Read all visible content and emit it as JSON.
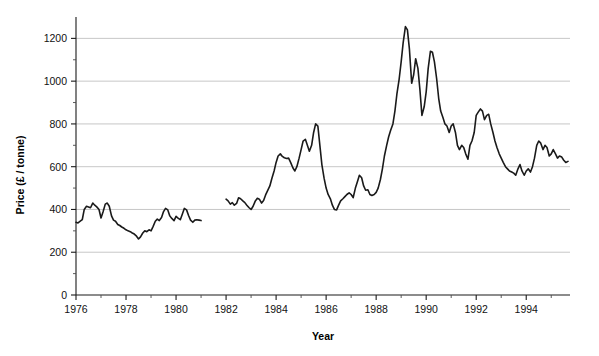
{
  "chart_data": {
    "type": "line",
    "title": "",
    "xlabel": "Year",
    "ylabel": "Price (£ / tonne)",
    "xlim": [
      1976.0,
      1995.75
    ],
    "ylim": [
      0,
      1300
    ],
    "grid": true,
    "legend": "none",
    "y_major_ticks": [
      0,
      200,
      400,
      600,
      800,
      1000,
      1200
    ],
    "y_minor_tick_interval": 100,
    "y_tick_labels": [
      "0",
      "200",
      "400",
      "600",
      "800",
      "1000",
      "1200"
    ],
    "x_major_ticks": [
      1976,
      1978,
      1980,
      1982,
      1984,
      1986,
      1988,
      1990,
      1992,
      1994
    ],
    "x_minor_ticks": [
      1977,
      1979,
      1981,
      1983,
      1985,
      1987,
      1989,
      1991,
      1993,
      1995
    ],
    "x_tick_labels": [
      "1976",
      "1978",
      "1980",
      "1982",
      "1984",
      "1986",
      "1988",
      "1990",
      "1992",
      "1994"
    ],
    "line_color": "#1a1a1a",
    "grid_color": "#b9b9b9",
    "axis_color": "#1a1a1a",
    "series": [
      {
        "name": "Price segment 1 (1976-1981)",
        "x": [
          1976.0,
          1976.08,
          1976.17,
          1976.25,
          1976.33,
          1976.42,
          1976.5,
          1976.58,
          1976.67,
          1976.75,
          1976.83,
          1976.92,
          1977.0,
          1977.08,
          1977.17,
          1977.25,
          1977.33,
          1977.42,
          1977.5,
          1977.58,
          1977.67,
          1977.75,
          1977.83,
          1977.92,
          1978.0,
          1978.08,
          1978.17,
          1978.25,
          1978.33,
          1978.42,
          1978.5,
          1978.58,
          1978.67,
          1978.75,
          1978.83,
          1978.92,
          1979.0,
          1979.08,
          1979.17,
          1979.25,
          1979.33,
          1979.42,
          1979.5,
          1979.58,
          1979.67,
          1979.75,
          1979.83,
          1979.92,
          1980.0,
          1980.08,
          1980.17,
          1980.25,
          1980.33,
          1980.42,
          1980.5,
          1980.58,
          1980.67,
          1980.75,
          1980.83,
          1980.92,
          1981.0
        ],
        "values": [
          340,
          337,
          345,
          352,
          400,
          415,
          412,
          408,
          430,
          420,
          412,
          400,
          360,
          388,
          425,
          430,
          415,
          370,
          350,
          345,
          330,
          325,
          318,
          312,
          305,
          300,
          296,
          290,
          285,
          275,
          262,
          272,
          290,
          300,
          296,
          305,
          300,
          320,
          345,
          355,
          348,
          362,
          390,
          405,
          398,
          370,
          358,
          348,
          368,
          360,
          352,
          378,
          405,
          398,
          372,
          350,
          340,
          350,
          352,
          350,
          348
        ]
      },
      {
        "name": "Price segment 2 (1982-1995)",
        "x": [
          1982.0,
          1982.08,
          1982.17,
          1982.25,
          1982.33,
          1982.42,
          1982.5,
          1982.58,
          1982.67,
          1982.75,
          1982.83,
          1982.92,
          1983.0,
          1983.08,
          1983.17,
          1983.25,
          1983.33,
          1983.42,
          1983.5,
          1983.58,
          1983.67,
          1983.75,
          1983.83,
          1983.92,
          1984.0,
          1984.08,
          1984.17,
          1984.25,
          1984.33,
          1984.42,
          1984.5,
          1984.58,
          1984.67,
          1984.75,
          1984.83,
          1984.92,
          1985.0,
          1985.08,
          1985.17,
          1985.25,
          1985.33,
          1985.42,
          1985.5,
          1985.58,
          1985.67,
          1985.75,
          1985.83,
          1985.92,
          1986.0,
          1986.08,
          1986.17,
          1986.25,
          1986.33,
          1986.42,
          1986.5,
          1986.58,
          1986.67,
          1986.75,
          1986.83,
          1986.92,
          1987.0,
          1987.08,
          1987.17,
          1987.25,
          1987.33,
          1987.42,
          1987.5,
          1987.58,
          1987.67,
          1987.75,
          1987.83,
          1987.92,
          1988.0,
          1988.08,
          1988.17,
          1988.25,
          1988.33,
          1988.42,
          1988.5,
          1988.58,
          1988.67,
          1988.75,
          1988.83,
          1988.92,
          1989.0,
          1989.08,
          1989.17,
          1989.25,
          1989.33,
          1989.42,
          1989.5,
          1989.58,
          1989.67,
          1989.75,
          1989.83,
          1989.92,
          1990.0,
          1990.08,
          1990.17,
          1990.25,
          1990.33,
          1990.42,
          1990.5,
          1990.58,
          1990.67,
          1990.75,
          1990.83,
          1990.92,
          1991.0,
          1991.08,
          1991.17,
          1991.25,
          1991.33,
          1991.42,
          1991.5,
          1991.58,
          1991.67,
          1991.75,
          1991.83,
          1991.92,
          1992.0,
          1992.08,
          1992.17,
          1992.25,
          1992.33,
          1992.42,
          1992.5,
          1992.58,
          1992.67,
          1992.75,
          1992.83,
          1992.92,
          1993.0,
          1993.08,
          1993.17,
          1993.25,
          1993.33,
          1993.42,
          1993.5,
          1993.58,
          1993.67,
          1993.75,
          1993.83,
          1993.92,
          1994.0,
          1994.08,
          1994.17,
          1994.25,
          1994.33,
          1994.42,
          1994.5,
          1994.58,
          1994.67,
          1994.75,
          1994.83,
          1994.92,
          1995.0,
          1995.08,
          1995.17,
          1995.25,
          1995.33,
          1995.42,
          1995.5,
          1995.58,
          1995.67
        ],
        "values": [
          448,
          440,
          425,
          432,
          420,
          428,
          455,
          450,
          440,
          432,
          420,
          408,
          400,
          415,
          440,
          452,
          448,
          430,
          442,
          468,
          490,
          510,
          545,
          580,
          620,
          650,
          660,
          648,
          642,
          638,
          640,
          620,
          595,
          580,
          600,
          640,
          680,
          720,
          728,
          700,
          672,
          700,
          760,
          800,
          790,
          700,
          610,
          545,
          500,
          470,
          450,
          420,
          400,
          398,
          420,
          440,
          450,
          460,
          470,
          478,
          470,
          455,
          500,
          530,
          560,
          548,
          510,
          490,
          492,
          470,
          465,
          470,
          480,
          500,
          540,
          590,
          650,
          700,
          740,
          770,
          800,
          860,
          940,
          1010,
          1090,
          1180,
          1255,
          1240,
          1150,
          990,
          1030,
          1105,
          1060,
          960,
          840,
          880,
          950,
          1060,
          1140,
          1135,
          1090,
          1010,
          920,
          860,
          830,
          800,
          790,
          760,
          790,
          800,
          760,
          700,
          680,
          700,
          690,
          660,
          635,
          700,
          720,
          760,
          840,
          855,
          870,
          860,
          820,
          840,
          845,
          800,
          760,
          720,
          690,
          660,
          640,
          620,
          600,
          590,
          580,
          575,
          570,
          560,
          590,
          610,
          580,
          560,
          580,
          590,
          575,
          600,
          640,
          700,
          720,
          710,
          680,
          700,
          690,
          650,
          660,
          680,
          660,
          640,
          650,
          645,
          630,
          620,
          625
        ]
      }
    ]
  },
  "axis_titles": {
    "y": "Price (£ / tonne)",
    "x": "Year"
  }
}
